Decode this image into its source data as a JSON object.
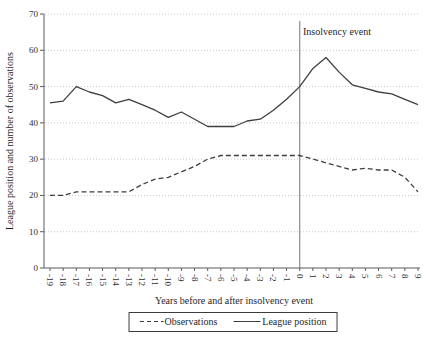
{
  "chart_data": {
    "type": "line",
    "title": "",
    "xlabel": "Years before and after insolvency event",
    "ylabel": "League position and number of observations",
    "annotation": "Insolvency event",
    "legend_position": "bottom-outside-boxed",
    "grid": "horizontal-dotted",
    "ylim": [
      0,
      70
    ],
    "yticks": [
      0,
      10,
      20,
      30,
      40,
      50,
      60,
      70
    ],
    "event_line_x": 0,
    "x": [
      -19,
      -18,
      -17,
      -16,
      -15,
      -14,
      -13,
      -12,
      -11,
      -10,
      -9,
      -8,
      -7,
      -6,
      -5,
      -4,
      -3,
      -2,
      -1,
      0,
      1,
      2,
      3,
      4,
      5,
      6,
      7,
      8,
      9
    ],
    "series": [
      {
        "name": "Observations",
        "style": "dashed",
        "values": [
          20,
          20,
          21,
          21,
          21,
          21,
          21,
          23,
          24.5,
          25,
          26.5,
          28,
          30,
          31,
          31,
          31,
          31,
          31,
          31,
          31,
          30,
          29,
          28,
          27,
          27.5,
          27,
          27,
          25,
          21
        ]
      },
      {
        "name": "League position",
        "style": "solid",
        "values": [
          45.5,
          46,
          50,
          48.5,
          47.5,
          45.5,
          46.5,
          45,
          43.5,
          41.5,
          43,
          41,
          39,
          39,
          39,
          40.5,
          41,
          43.5,
          46.5,
          50,
          55,
          58,
          54,
          50.5,
          49.5,
          48.5,
          48,
          46.5,
          45
        ]
      }
    ],
    "colors": {
      "line": "#3f3f3f",
      "grid": "#c9c9c9",
      "axis": "#5a5a5a",
      "event_line": "#8c8c8c",
      "text": "#1f1f1f",
      "background": "#ffffff"
    }
  }
}
